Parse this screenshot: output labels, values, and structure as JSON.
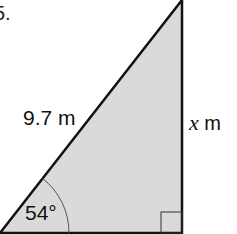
{
  "question": {
    "number": "5."
  },
  "triangle": {
    "hypotenuse_label": "9.7 m",
    "opposite_label": {
      "variable": "x",
      "unit": "m"
    },
    "angle_label": "54°",
    "right_angle": true,
    "fill_color": "#d9d9d9",
    "stroke_color": "#111111"
  }
}
